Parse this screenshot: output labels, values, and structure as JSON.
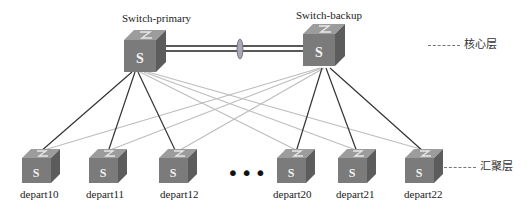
{
  "diagram": {
    "type": "network-topology",
    "core_switches": [
      {
        "id": "primary",
        "label": "Switch-primary",
        "icon_letter": "S"
      },
      {
        "id": "backup",
        "label": "Switch-backup",
        "icon_letter": "S"
      }
    ],
    "core_link": {
      "from": "primary",
      "to": "backup",
      "style": "double-line-with-aggregation-ellipse"
    },
    "access_switches": [
      {
        "id": "depart10",
        "label": "depart10",
        "icon_letter": "S"
      },
      {
        "id": "depart11",
        "label": "depart11",
        "icon_letter": "S"
      },
      {
        "id": "depart12",
        "label": "depart12",
        "icon_letter": "S"
      },
      {
        "id": "depart20",
        "label": "depart20",
        "icon_letter": "S"
      },
      {
        "id": "depart21",
        "label": "depart21",
        "icon_letter": "S"
      },
      {
        "id": "depart22",
        "label": "depart22",
        "icon_letter": "S"
      }
    ],
    "ellipsis": "•••",
    "layers": {
      "core": "核心层",
      "aggregation": "汇聚层"
    },
    "links": {
      "primary_dark": [
        "depart10",
        "depart11",
        "depart12"
      ],
      "primary_light": [
        "depart20",
        "depart21",
        "depart22"
      ],
      "backup_dark": [
        "depart20",
        "depart21",
        "depart22"
      ],
      "backup_light": [
        "depart10",
        "depart11",
        "depart12"
      ]
    },
    "colors": {
      "switch_front": "#7a7a7a",
      "switch_top": "#9a9a9a",
      "switch_side": "#5e5e5e",
      "dark_link": "#333333",
      "light_link": "#b8b8b8"
    }
  }
}
